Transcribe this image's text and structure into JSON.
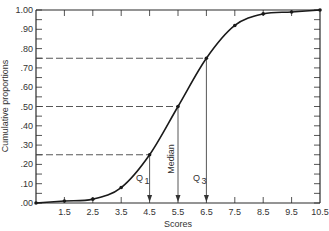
{
  "chart_data": {
    "type": "line",
    "title": "",
    "xlabel": "Scores",
    "ylabel": "Cumulative proportions",
    "x_ticks": [
      "1.5",
      "2.5",
      "3.5",
      "4.5",
      "5.5",
      "6.5",
      "7.5",
      "8.5",
      "9.5",
      "10.5"
    ],
    "y_ticks": [
      ".00",
      ".10",
      ".20",
      ".30",
      ".40",
      ".50",
      ".60",
      ".70",
      ".80",
      ".90",
      "1.00"
    ],
    "xlim": [
      0.5,
      10.5
    ],
    "ylim": [
      0,
      1.0
    ],
    "grid": false,
    "series": [
      {
        "name": "Cumulative proportion",
        "x": [
          0.5,
          1.5,
          2.5,
          3.5,
          4.5,
          5.5,
          6.5,
          7.5,
          8.5,
          9.5,
          10.5
        ],
        "y": [
          0.0,
          0.01,
          0.02,
          0.08,
          0.25,
          0.5,
          0.75,
          0.92,
          0.98,
          0.99,
          1.0
        ]
      }
    ],
    "reference_lines": [
      {
        "label": "Q1",
        "proportion": 0.25,
        "score": 4.5
      },
      {
        "label": "Median",
        "proportion": 0.5,
        "score": 5.5
      },
      {
        "label": "Q3",
        "proportion": 0.75,
        "score": 6.5
      }
    ],
    "annotations": [
      "Q1",
      "Median",
      "Q3"
    ]
  }
}
